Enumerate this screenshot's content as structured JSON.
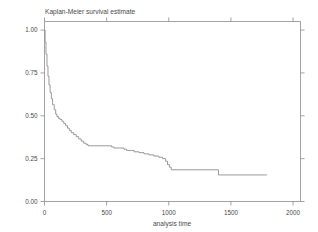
{
  "chart_data": {
    "type": "line",
    "subtype": "kaplan-meier-step",
    "title": "Kaplan-Meier survival estimate",
    "xlabel": "analysis time",
    "ylabel": "",
    "xlim": [
      0,
      2060
    ],
    "ylim": [
      0.0,
      1.05
    ],
    "grid": false,
    "legend": null,
    "xticks": [
      0,
      500,
      1000,
      1500,
      2000
    ],
    "xticklabels": [
      "0",
      "500",
      "1000",
      "1500",
      "2000"
    ],
    "yticks": [
      0.0,
      0.25,
      0.5,
      0.75,
      1.0
    ],
    "yticklabels": [
      "0.00",
      "0.25",
      "0.50",
      "0.75",
      "1.00"
    ],
    "series": [
      {
        "name": "survival",
        "color": "#8f8f8f",
        "x": [
          0,
          5,
          12,
          20,
          28,
          36,
          45,
          55,
          65,
          78,
          90,
          100,
          112,
          125,
          140,
          155,
          170,
          185,
          200,
          215,
          235,
          255,
          275,
          295,
          315,
          335,
          350,
          520,
          540,
          560,
          600,
          640,
          660,
          700,
          720,
          760,
          800,
          840,
          880,
          920,
          950,
          975,
          990,
          1005,
          1020,
          1380,
          1400,
          1790
        ],
        "y": [
          1.0,
          0.93,
          0.86,
          0.79,
          0.73,
          0.68,
          0.635,
          0.6,
          0.565,
          0.535,
          0.51,
          0.495,
          0.485,
          0.478,
          0.468,
          0.455,
          0.442,
          0.428,
          0.415,
          0.402,
          0.39,
          0.378,
          0.365,
          0.352,
          0.34,
          0.333,
          0.325,
          0.325,
          0.318,
          0.312,
          0.312,
          0.305,
          0.298,
          0.298,
          0.29,
          0.285,
          0.278,
          0.272,
          0.265,
          0.258,
          0.25,
          0.235,
          0.215,
          0.2,
          0.185,
          0.185,
          0.155,
          0.155
        ]
      }
    ]
  },
  "axes": {
    "x_axis_title": "analysis time",
    "x_tick_labels": [
      "0",
      "500",
      "1000",
      "1500",
      "2000"
    ],
    "y_tick_labels": [
      "0.00",
      "0.25",
      "0.50",
      "0.75",
      "1.00"
    ]
  },
  "title": {
    "text": "Kaplan-Meier survival estimate"
  },
  "colors": {
    "curve": "#8f8f8f",
    "axis": "#8c8c8c",
    "text": "#4a4a4a",
    "background": "#ffffff"
  }
}
